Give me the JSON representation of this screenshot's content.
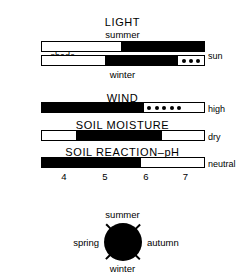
{
  "figure": {
    "kind": "ecological-indicator-diagram"
  },
  "sections": [
    {
      "id": "light",
      "title": "LIGHT",
      "sub_top": "summer",
      "sub_bottom": "winter",
      "left_label": "shade",
      "right_label": "sun",
      "bars": [
        {
          "id": "light-summer",
          "name": "summer",
          "segments": [
            {
              "fill": "white",
              "pct": 49
            },
            {
              "fill": "black",
              "pct": 51
            }
          ]
        },
        {
          "id": "light-winter",
          "name": "winter",
          "segments": [
            {
              "fill": "white",
              "pct": 39
            },
            {
              "fill": "black",
              "pct": 45
            },
            {
              "fill": "dotted",
              "pct": 16,
              "dots": 3
            }
          ]
        }
      ]
    },
    {
      "id": "wind",
      "title": "WIND",
      "left_label": "low",
      "right_label": "high",
      "bars": [
        {
          "id": "wind-bar",
          "name": "wind",
          "segments": [
            {
              "fill": "black",
              "pct": 63
            },
            {
              "fill": "dotted",
              "pct": 25,
              "dots": 5
            },
            {
              "fill": "white",
              "pct": 12
            }
          ]
        }
      ]
    },
    {
      "id": "soil-moisture",
      "title": "SOIL MOISTURE",
      "left_label": "wet",
      "right_label": "dry",
      "bars": [
        {
          "id": "soil-moisture-bar",
          "name": "soil-moisture",
          "segments": [
            {
              "fill": "white",
              "pct": 21
            },
            {
              "fill": "black",
              "pct": 53
            },
            {
              "fill": "white",
              "pct": 26
            }
          ]
        }
      ]
    },
    {
      "id": "soil-reaction",
      "title": "SOIL REACTION–pH",
      "left_label": "acidic",
      "right_label": "neutral",
      "bars": [
        {
          "id": "soil-reaction-bar",
          "name": "soil-reaction-ph",
          "segments": [
            {
              "fill": "black",
              "pct": 61
            },
            {
              "fill": "white",
              "pct": 39
            }
          ]
        }
      ],
      "scale": {
        "ticks": [
          "4",
          "5",
          "6",
          "7"
        ],
        "positions_pct": [
          14,
          39,
          64,
          88
        ]
      }
    }
  ],
  "season_wheel": {
    "top": "summer",
    "bottom": "winter",
    "left": "spring",
    "right": "autumn",
    "disc_color": "#000000",
    "tick_count": 4
  },
  "chart_data": {
    "type": "bar",
    "orientation": "horizontal",
    "note": "Each horizontal bar spans 0-100% of an environmental gradient; the filled (black) portion marks the species' tolerance range.",
    "series": [
      {
        "name": "LIGHT – summer",
        "axis_low": "shade",
        "axis_high": "sun",
        "segments": [
          {
            "fill": "white",
            "start_pct": 0,
            "end_pct": 49
          },
          {
            "fill": "black",
            "start_pct": 49,
            "end_pct": 100
          }
        ]
      },
      {
        "name": "LIGHT – winter",
        "axis_low": "shade",
        "axis_high": "sun",
        "segments": [
          {
            "fill": "white",
            "start_pct": 0,
            "end_pct": 39
          },
          {
            "fill": "black",
            "start_pct": 39,
            "end_pct": 84
          },
          {
            "fill": "dotted",
            "start_pct": 84,
            "end_pct": 100
          }
        ]
      },
      {
        "name": "WIND",
        "axis_low": "low",
        "axis_high": "high",
        "segments": [
          {
            "fill": "black",
            "start_pct": 0,
            "end_pct": 63
          },
          {
            "fill": "dotted",
            "start_pct": 63,
            "end_pct": 88
          },
          {
            "fill": "white",
            "start_pct": 88,
            "end_pct": 100
          }
        ]
      },
      {
        "name": "SOIL MOISTURE",
        "axis_low": "wet",
        "axis_high": "dry",
        "segments": [
          {
            "fill": "white",
            "start_pct": 0,
            "end_pct": 21
          },
          {
            "fill": "black",
            "start_pct": 21,
            "end_pct": 74
          },
          {
            "fill": "white",
            "start_pct": 74,
            "end_pct": 100
          }
        ]
      },
      {
        "name": "SOIL REACTION–pH",
        "axis_low": "acidic",
        "axis_high": "neutral",
        "tick_labels": [
          "4",
          "5",
          "6",
          "7"
        ],
        "segments": [
          {
            "fill": "black",
            "start_pct": 0,
            "end_pct": 61
          },
          {
            "fill": "white",
            "start_pct": 61,
            "end_pct": 100
          }
        ]
      }
    ],
    "legend": [],
    "grid": false
  }
}
